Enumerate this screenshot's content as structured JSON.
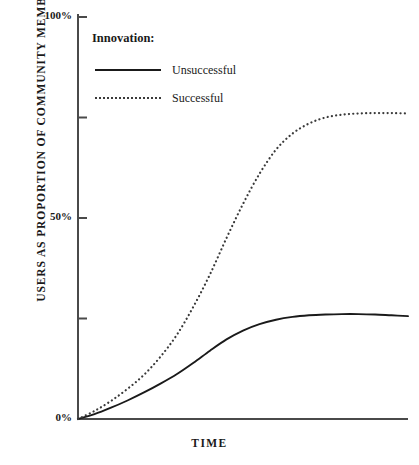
{
  "chart_data": {
    "type": "line",
    "title": "",
    "xlabel": "TIME",
    "ylabel": "USERS AS PROPORTION OF COMMUNITY MEMBERS",
    "ylim": [
      0,
      100
    ],
    "ytick_labels": [
      "0%",
      "50%",
      "100%"
    ],
    "ytick_values": [
      0,
      50,
      100
    ],
    "yticks_all": [
      0,
      25,
      50,
      75,
      100
    ],
    "xlim": [
      0,
      100
    ],
    "xtick_labels": [],
    "grid": false,
    "legend_position": "upper-left-inside",
    "legend_title": "Innovation:",
    "series": [
      {
        "name": "Unsuccessful",
        "style": "solid",
        "color": "#1a1a1a",
        "plateau": 26,
        "x": [
          0,
          5,
          10,
          15,
          20,
          25,
          30,
          35,
          40,
          45,
          50,
          55,
          60,
          65,
          70,
          75,
          80,
          85,
          90,
          95,
          100
        ],
        "y": [
          0,
          1.2,
          2.8,
          4.6,
          6.6,
          8.8,
          11.2,
          14.0,
          17.0,
          19.8,
          22.0,
          23.6,
          24.7,
          25.4,
          25.8,
          26.0,
          26.1,
          26.1,
          26.0,
          25.8,
          25.6
        ]
      },
      {
        "name": "Successful",
        "style": "dotted",
        "color": "#3a3a3a",
        "plateau": 76,
        "x": [
          0,
          5,
          10,
          15,
          20,
          25,
          30,
          35,
          40,
          45,
          50,
          55,
          60,
          65,
          70,
          75,
          80,
          85,
          90,
          95,
          100
        ],
        "y": [
          0,
          2.0,
          4.5,
          7.5,
          11.0,
          15.5,
          21.0,
          28.0,
          36.0,
          45.0,
          53.5,
          61.0,
          67.0,
          71.0,
          73.5,
          75.0,
          75.7,
          76.0,
          76.1,
          76.1,
          76.0
        ]
      }
    ]
  },
  "axis": {
    "ylabel": "USERS AS PROPORTION OF COMMUNITY MEMBERS",
    "xlabel": "TIME",
    "tick_100": "100%",
    "tick_50": "50%",
    "tick_0": "0%"
  },
  "legend": {
    "title": "Innovation:",
    "items": [
      {
        "label": "Unsuccessful",
        "style": "solid"
      },
      {
        "label": "Successful",
        "style": "dotted"
      }
    ]
  },
  "colors": {
    "background": "#ffffff",
    "axis": "#4a4a4a",
    "solid_series": "#1a1a1a",
    "dotted_series": "#3a3a3a"
  }
}
